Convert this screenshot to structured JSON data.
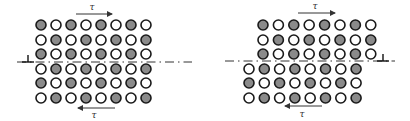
{
  "colors": {
    "filled": "#8a8a8a",
    "empty": "#ffffff",
    "stroke": "#1a1a1a",
    "line": "#333333"
  },
  "circle_radius": 5,
  "panels": [
    {
      "name": "left",
      "rows": [
        {
          "y": 25,
          "x0": 41,
          "pitch": 15,
          "pattern": [
            1,
            0,
            1,
            0,
            1,
            0,
            1,
            0
          ]
        },
        {
          "y": 40,
          "x0": 41,
          "pitch": 15,
          "pattern": [
            0,
            1,
            0,
            1,
            0,
            1,
            0,
            1
          ]
        },
        {
          "y": 54,
          "x0": 41,
          "pitch": 15,
          "pattern": [
            1,
            0,
            1,
            0,
            1,
            0,
            1,
            0
          ]
        },
        {
          "y": 69,
          "x0": 41,
          "pitch": 15,
          "pattern": [
            0,
            1,
            0,
            1,
            0,
            1,
            0,
            1
          ]
        },
        {
          "y": 83,
          "x0": 41,
          "pitch": 15,
          "pattern": [
            1,
            0,
            1,
            0,
            1,
            0,
            1,
            0
          ]
        },
        {
          "y": 98,
          "x0": 41,
          "pitch": 15,
          "pattern": [
            0,
            1,
            0,
            1,
            0,
            1,
            0,
            1
          ]
        }
      ],
      "slip_line": {
        "x1": 17,
        "x2": 192,
        "y": 62
      },
      "dislocation": {
        "x": 28,
        "y": 62,
        "symbol": "⊥"
      },
      "top_arrow": {
        "x1": 76,
        "x2": 112,
        "y": 14,
        "direction": "right",
        "label": "τ",
        "label_x": 92,
        "label_y": 10
      },
      "bottom_arrow": {
        "x1": 78,
        "x2": 115,
        "y": 108,
        "direction": "left",
        "label": "τ",
        "label_x": 94,
        "label_y": 118
      }
    },
    {
      "name": "right",
      "rows": [
        {
          "y": 25,
          "x0": 263,
          "pitch": 15.4,
          "pattern": [
            1,
            0,
            1,
            0,
            1,
            0,
            1,
            0
          ]
        },
        {
          "y": 40,
          "x0": 263,
          "pitch": 15.4,
          "pattern": [
            0,
            1,
            0,
            1,
            0,
            1,
            0,
            1
          ]
        },
        {
          "y": 54,
          "x0": 263,
          "pitch": 15.4,
          "pattern": [
            1,
            0,
            1,
            0,
            1,
            0,
            1,
            0
          ]
        },
        {
          "y": 69,
          "x0": 249,
          "pitch": 15.3,
          "pattern": [
            0,
            1,
            0,
            1,
            0,
            1,
            0,
            1
          ]
        },
        {
          "y": 83,
          "x0": 249,
          "pitch": 15.3,
          "pattern": [
            1,
            0,
            1,
            0,
            1,
            0,
            1,
            0
          ]
        },
        {
          "y": 98,
          "x0": 249,
          "pitch": 15.3,
          "pattern": [
            0,
            1,
            0,
            1,
            0,
            1,
            0,
            1
          ]
        }
      ],
      "slip_line": {
        "x1": 225,
        "x2": 395,
        "y": 61
      },
      "dislocation": {
        "x": 383,
        "y": 61,
        "symbol": "⊥"
      },
      "top_arrow": {
        "x1": 298,
        "x2": 335,
        "y": 13,
        "direction": "right",
        "label": "τ",
        "label_x": 315,
        "label_y": 9
      },
      "bottom_arrow": {
        "x1": 285,
        "x2": 322,
        "y": 106,
        "direction": "left",
        "label": "τ",
        "label_x": 302,
        "label_y": 117
      }
    }
  ]
}
